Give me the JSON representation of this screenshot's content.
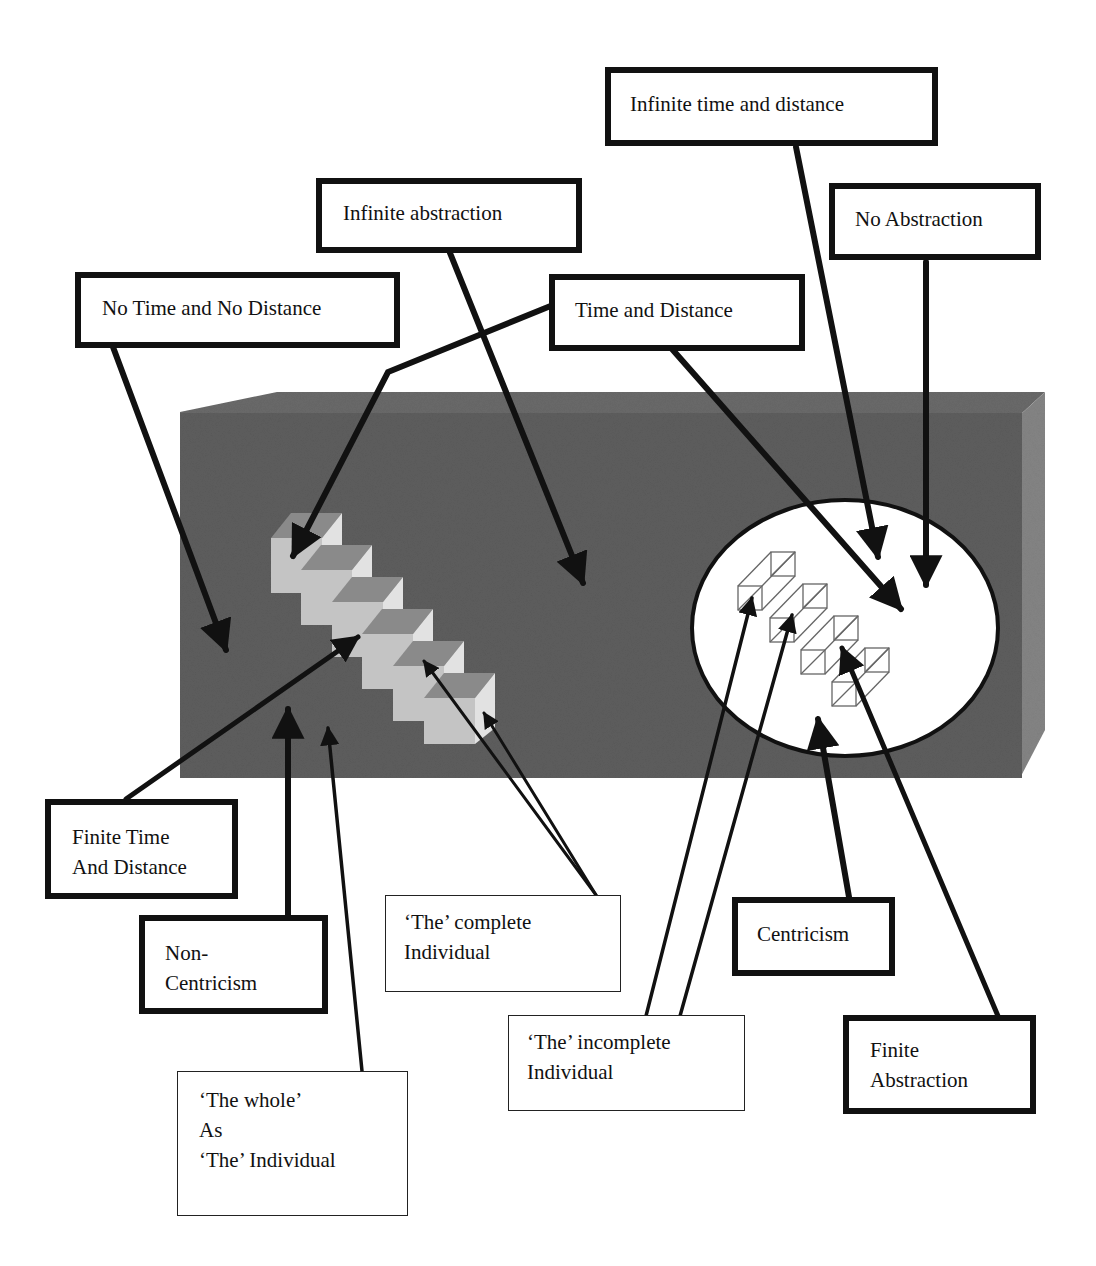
{
  "diagram": {
    "colors": {
      "block_front": "#5f5f5f",
      "block_top": "#6a6a6a",
      "block_side": "#858585",
      "cube_light": "#c8c8c8",
      "cube_top": "#8a8a8a",
      "cube_side": "#dedede",
      "ellipse_fill": "#ffffff",
      "stroke": "#111111"
    },
    "labels": {
      "infinite_time_distance": {
        "lines": [
          "Infinite time and distance"
        ]
      },
      "infinite_abstraction": {
        "lines": [
          "Infinite abstraction"
        ]
      },
      "no_abstraction": {
        "lines": [
          "No Abstraction"
        ]
      },
      "no_time_no_distance": {
        "lines": [
          "No Time and No Distance"
        ]
      },
      "time_and_distance": {
        "lines": [
          "Time and Distance"
        ]
      },
      "finite_time_distance": {
        "lines": [
          "Finite Time",
          "And Distance"
        ]
      },
      "non_centricism": {
        "lines": [
          "Non-",
          "Centricism"
        ]
      },
      "complete_individual": {
        "lines": [
          "‘The’ complete",
          "Individual"
        ]
      },
      "centricism": {
        "lines": [
          "Centricism"
        ]
      },
      "incomplete_individual": {
        "lines": [
          "‘The’ incomplete",
          "Individual"
        ]
      },
      "finite_abstraction": {
        "lines": [
          "Finite",
          "Abstraction"
        ]
      },
      "whole_as_individual": {
        "lines": [
          "‘The whole’",
          "As",
          "‘The’ Individual"
        ]
      }
    }
  }
}
